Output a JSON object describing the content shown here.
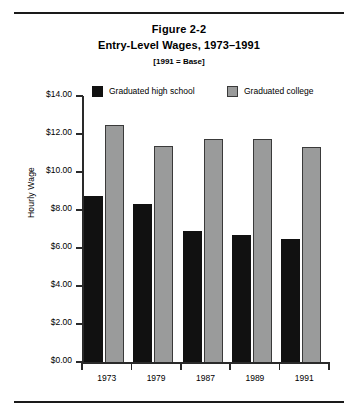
{
  "figure": {
    "title": "Figure 2-2",
    "subtitle": "Entry-Level Wages, 1973–1991",
    "note": "[1991 = Base]"
  },
  "legend": {
    "items": [
      {
        "label": "Graduated high school",
        "color": "#111111"
      },
      {
        "label": "Graduated college",
        "color": "#9a9b9b"
      }
    ]
  },
  "chart_data": {
    "type": "bar",
    "title": "Entry-Level Wages, 1973–1991",
    "subtitle": "[1991 = Base]",
    "figure_number": "Figure 2-2",
    "xlabel": "",
    "ylabel": "Hourly Wage",
    "categories": [
      "1973",
      "1979",
      "1987",
      "1989",
      "1991"
    ],
    "series": [
      {
        "name": "Graduated high school",
        "color": "#111111",
        "values": [
          8.75,
          8.3,
          6.9,
          6.7,
          6.5
        ]
      },
      {
        "name": "Graduated college",
        "color": "#9a9b9b",
        "values": [
          12.5,
          11.35,
          11.75,
          11.75,
          11.3
        ]
      }
    ],
    "ylim": [
      0,
      14
    ],
    "ytick_values": [
      0,
      2,
      4,
      6,
      8,
      10,
      12,
      14
    ],
    "ytick_labels": [
      "$0.00",
      "$2.00",
      "$4.00",
      "$6.00",
      "$8.00",
      "$10.00",
      "$12.00",
      "$14.00"
    ],
    "grid": false,
    "legend_position": "top"
  }
}
